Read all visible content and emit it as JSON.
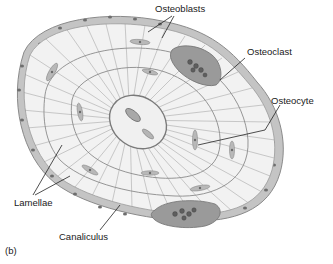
{
  "figure": {
    "panel_label": "(b)"
  },
  "labels": {
    "osteoblasts": "Osteoblasts",
    "osteoclast": "Osteoclast",
    "osteocyte": "Osteocyte",
    "lamellae": "Lamellae",
    "canaliculus": "Canaliculus"
  },
  "colors": {
    "matrix": "#f2f2f2",
    "cell_fill": "#bdbdbd",
    "cell_stroke": "#8a8a8a",
    "nucleus": "#6a6a6a",
    "osteoclast": "#9a9a9a",
    "canaliculi": "#8c8c8c",
    "leader": "#222222",
    "text": "#1a1a1a"
  }
}
